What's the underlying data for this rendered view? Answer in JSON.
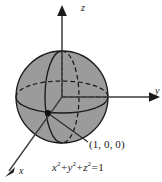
{
  "figure": {
    "type": "3d-coordinate-sphere-diagram",
    "background_color": "#ffffff",
    "sphere": {
      "fill_color": "#9b9b9b",
      "stroke_color": "#1a1a1a",
      "center_px": [
        62,
        97
      ],
      "radius_px": 46,
      "radius_value": 1
    },
    "axes": {
      "z": {
        "label": "z",
        "direction": "up",
        "arrow": true
      },
      "y": {
        "label": "y",
        "direction": "right",
        "arrow": true
      },
      "x": {
        "label": "x",
        "direction": "down-left",
        "arrow": true
      }
    },
    "marked_point": {
      "label": "(1, 0, 0)",
      "dot_px": [
        48,
        113
      ],
      "leader_to_px": [
        88,
        142
      ]
    },
    "equation": {
      "full_text": "x² + y² + z² = 1",
      "terms": [
        {
          "var": "x",
          "exp": "2"
        },
        {
          "var": "y",
          "exp": "2"
        },
        {
          "var": "z",
          "exp": "2"
        }
      ],
      "plus": "+",
      "equals": "=",
      "rhs": "1"
    },
    "curves": {
      "equator": "horizontal ellipse, front solid, back dashed",
      "meridian": "vertical ellipse, front solid, back dashed"
    }
  }
}
